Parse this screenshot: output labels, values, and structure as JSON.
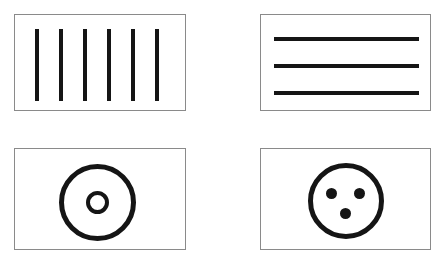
{
  "canvas": {
    "width": 446,
    "height": 262,
    "background": "#ffffff",
    "ink_color": "#151515",
    "panel_border_color": "#8a8a8a"
  },
  "panels": [
    {
      "id": "vertical-bars",
      "name": "Vertical bars panel",
      "x": 14,
      "y": 14,
      "width": 172,
      "height": 97,
      "figure_type": "vertical-stripes",
      "count": 6,
      "bar_width": 4,
      "bar_height": 72,
      "bar_top": 14,
      "bar_x_positions": [
        20,
        44,
        68,
        92,
        116,
        140
      ]
    },
    {
      "id": "horizontal-lines",
      "name": "Horizontal lines panel",
      "x": 260,
      "y": 14,
      "width": 171,
      "height": 97,
      "figure_type": "horizontal-stripes",
      "count": 3,
      "line_height": 4,
      "line_width": 145,
      "line_left": 13,
      "line_y_positions": [
        22,
        49,
        76
      ]
    },
    {
      "id": "concentric-circles",
      "name": "Concentric circles panel",
      "x": 14,
      "y": 148,
      "width": 172,
      "height": 102,
      "figure_type": "concentric-rings",
      "rings": [
        {
          "id": "outer-ring",
          "cx": 82,
          "cy": 53,
          "diameter": 77,
          "stroke": 5
        },
        {
          "id": "inner-ring",
          "cx": 82,
          "cy": 53,
          "diameter": 23,
          "stroke": 4
        }
      ]
    },
    {
      "id": "three-dot-face",
      "name": "Circle with three dots panel",
      "x": 260,
      "y": 148,
      "width": 171,
      "height": 102,
      "figure_type": "circle-with-dots",
      "rings": [
        {
          "id": "face-outline",
          "cx": 85,
          "cy": 52,
          "diameter": 76,
          "stroke": 5
        }
      ],
      "dots": [
        {
          "id": "dot-left",
          "cx": 70,
          "cy": 44,
          "diameter": 11
        },
        {
          "id": "dot-right",
          "cx": 98,
          "cy": 44,
          "diameter": 11
        },
        {
          "id": "dot-bottom",
          "cx": 84,
          "cy": 64,
          "diameter": 11
        }
      ]
    }
  ]
}
